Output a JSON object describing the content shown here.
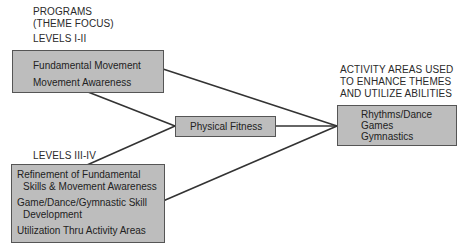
{
  "programs_header": {
    "line1": "PROGRAMS",
    "line2": "(THEME FOCUS)",
    "levels_1": "LEVELS I-II",
    "levels_2": "LEVELS III-IV"
  },
  "top_box": {
    "items": [
      "Fundamental Movement",
      "Movement Awareness"
    ]
  },
  "bottom_box": {
    "items": [
      "Refinement of Fundamental",
      "Skills & Movement Awareness",
      "Game/Dance/Gymnastic Skill",
      "Development",
      "Utilization Thru Activity Areas"
    ]
  },
  "center_box": {
    "label": "Physical Fitness"
  },
  "activity_header": {
    "line1": "ACTIVITY AREAS USED",
    "line2": "TO ENHANCE THEMES",
    "line3": "AND UTILIZE ABILITIES"
  },
  "right_box": {
    "items": [
      "Rhythms/Dance",
      "Games",
      "Gymnastics"
    ]
  },
  "colors": {
    "box_fill": "#bdbdbd",
    "box_border": "#555555",
    "line": "#333333"
  }
}
